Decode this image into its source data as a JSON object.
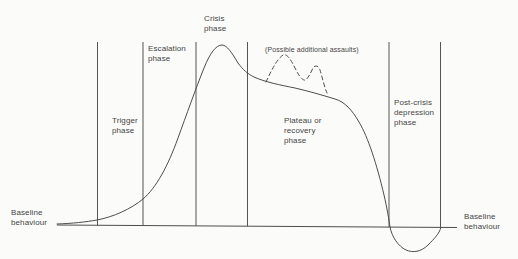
{
  "figure_type": "assault-cycle-phase-diagram",
  "labels": {
    "crisis_phase": "Crisis\nphase",
    "escalation_phase": "Escalation\nphase",
    "trigger_phase": "Trigger\nphase",
    "plateau_phase": "Plateau or\nrecovery\nphase",
    "post_crisis_phase": "Post-crisis\ndepression\nphase",
    "additional_assaults_note": "(Possible additional assaults)",
    "baseline_left": "Baseline\nbehaviour",
    "baseline_right": "Baseline\nbehaviour"
  },
  "phases_in_order": [
    "Trigger phase",
    "Escalation phase",
    "Crisis phase",
    "Plateau or recovery phase",
    "Post-crisis depression phase"
  ],
  "curve_description": {
    "solid_curve": "Arousal rises from baseline through trigger and escalation phases, peaks in crisis phase, declines along a plateau/recovery slope, dips below baseline during post-crisis depression phase, then returns to baseline",
    "dashed_curve": "Two smaller dashed peaks above the plateau representing possible additional assaults"
  },
  "colors": {
    "line": "#4d4d4d",
    "text": "#454545",
    "background": "#fbfbf9"
  }
}
